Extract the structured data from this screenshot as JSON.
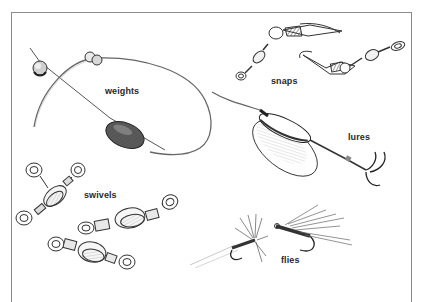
{
  "illustration": {
    "labels": {
      "weights": "weights",
      "snaps": "snaps",
      "lures": "lures",
      "swivels": "swivels",
      "flies": "flies"
    },
    "colors": {
      "ink": "#2a2a2a",
      "line": "#555555",
      "frame": "#8a8a8a",
      "background": "#ffffff"
    }
  }
}
